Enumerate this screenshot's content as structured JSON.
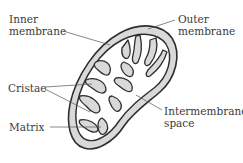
{
  "diagram": {
    "labels": {
      "inner_membrane": {
        "line1": "Inner",
        "line2": "membrane"
      },
      "outer_membrane": {
        "line1": "Outer",
        "line2": "membrane"
      },
      "cristae": "Cristae",
      "matrix": "Matrix",
      "intermembrane_space": {
        "line1": "Intermembrane",
        "line2": "space"
      }
    },
    "colors": {
      "outline": "#2e2e2e",
      "membrane_fill": "#d9d9d9",
      "matrix_fill": "#ffffff",
      "leader_line": "#555555",
      "text": "#3a3a3a"
    }
  }
}
